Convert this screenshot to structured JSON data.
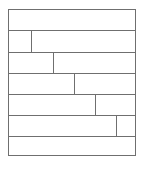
{
  "diagram": {
    "type": "staggered-block-grid",
    "line_color": "#6f6f6f",
    "background": "#ffffff",
    "frame": {
      "x": 8,
      "y": 9,
      "width": 128,
      "height": 147
    },
    "rows": [
      {
        "index": 1,
        "top": 0,
        "height": 20,
        "divider_x": null
      },
      {
        "index": 2,
        "top": 20,
        "height": 22,
        "divider_x": 22
      },
      {
        "index": 3,
        "top": 42,
        "height": 21,
        "divider_x": 44
      },
      {
        "index": 4,
        "top": 63,
        "height": 21,
        "divider_x": 65
      },
      {
        "index": 5,
        "top": 84,
        "height": 21,
        "divider_x": 86
      },
      {
        "index": 6,
        "top": 105,
        "height": 21,
        "divider_x": 107
      },
      {
        "index": 7,
        "top": 126,
        "height": 21,
        "divider_x": null
      }
    ]
  }
}
